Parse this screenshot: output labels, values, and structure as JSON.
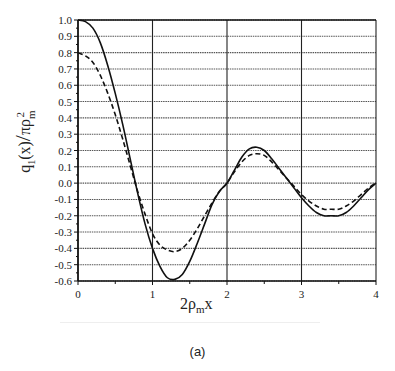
{
  "chart_data": {
    "type": "line",
    "title": "",
    "caption": "(a)",
    "xlabel": "2ρmx",
    "ylabel": "q1(x) / πρm²",
    "xlim": [
      0,
      4
    ],
    "ylim": [
      -0.6,
      1.0
    ],
    "x_ticks": [
      "0",
      "1",
      "2",
      "3",
      "4"
    ],
    "y_ticks": [
      "1.0",
      "0.9",
      "0.8",
      "0.7",
      "0.6",
      "0.5",
      "0.4",
      "0.3",
      "0.2",
      "0.1",
      "0.0",
      "-0.1",
      "-0.2",
      "-0.3",
      "-0.4",
      "-0.5",
      "-0.6"
    ],
    "grid": true,
    "legend": null,
    "x": [
      0,
      0.1,
      0.2,
      0.3,
      0.4,
      0.5,
      0.6,
      0.7,
      0.8,
      0.9,
      1.0,
      1.1,
      1.2,
      1.3,
      1.4,
      1.5,
      1.6,
      1.7,
      1.8,
      1.9,
      2.0,
      2.1,
      2.2,
      2.3,
      2.4,
      2.5,
      2.6,
      2.7,
      2.8,
      2.9,
      3.0,
      3.1,
      3.2,
      3.3,
      3.4,
      3.5,
      3.6,
      3.7,
      3.8,
      3.9,
      4.0
    ],
    "series": [
      {
        "name": "solid",
        "style": "solid",
        "values": [
          1.0,
          0.99,
          0.95,
          0.86,
          0.72,
          0.55,
          0.36,
          0.15,
          -0.06,
          -0.25,
          -0.4,
          -0.51,
          -0.58,
          -0.59,
          -0.56,
          -0.48,
          -0.37,
          -0.25,
          -0.13,
          -0.05,
          0.0,
          0.08,
          0.16,
          0.21,
          0.22,
          0.2,
          0.15,
          0.09,
          0.03,
          -0.03,
          -0.09,
          -0.14,
          -0.18,
          -0.2,
          -0.2,
          -0.2,
          -0.18,
          -0.14,
          -0.09,
          -0.04,
          0.0
        ]
      },
      {
        "name": "dashed",
        "style": "dashed",
        "values": [
          0.8,
          0.78,
          0.74,
          0.66,
          0.55,
          0.42,
          0.27,
          0.11,
          -0.05,
          -0.19,
          -0.31,
          -0.38,
          -0.41,
          -0.42,
          -0.4,
          -0.35,
          -0.28,
          -0.2,
          -0.12,
          -0.05,
          0.0,
          0.07,
          0.13,
          0.17,
          0.18,
          0.17,
          0.13,
          0.08,
          0.03,
          -0.02,
          -0.07,
          -0.11,
          -0.14,
          -0.16,
          -0.16,
          -0.16,
          -0.14,
          -0.11,
          -0.07,
          -0.03,
          0.0
        ]
      }
    ]
  },
  "labels": {
    "xlabel_main": "2ρ",
    "xlabel_sub": "m",
    "xlabel_tail": "x",
    "ylabel_q": "q",
    "ylabel_q_sub": "1",
    "ylabel_arg": "(x)",
    "ylabel_slash": "/",
    "ylabel_pi": "πρ",
    "ylabel_sup": "2",
    "ylabel_sub": "m",
    "caption": "(a)"
  }
}
